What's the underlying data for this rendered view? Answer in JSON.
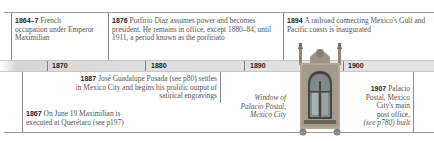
{
  "timeline": {
    "decades": [
      "1870",
      "1880",
      "1890",
      "1900"
    ],
    "events_above": [
      {
        "year": "1864–7",
        "text": "French occupation under Emperor Maximilian"
      },
      {
        "year": "1876",
        "text": "Porfirio Díaz assumes power and becomes president. He remains in office, except 1880–84, until 1911, a period known as the porfiriato"
      },
      {
        "year": "1894",
        "text": "A railroad connecting Mexico's Gulf and Pacific coasts is inaugurated"
      }
    ],
    "events_below": [
      {
        "year": "1887",
        "text": "José Guadalupe Posada (see p80) settles in Mexico City and begins his prolific output of satirical engravings"
      },
      {
        "year": "1867",
        "text": "On June 19 Maximilian is executed at Querétaro (see p197)"
      },
      {
        "year": "1907",
        "text": "Palacio Postal, Mexico City's main post office, (see p780) built"
      }
    ],
    "caption": "Window of Palacio Postal, Mexico City",
    "caption_lines": [
      "Window of",
      "Palacio Postal,",
      "Mexico City"
    ],
    "event_1907_lines": [
      "Palacio",
      "Postal, Mexico",
      "City's main",
      "post office,",
      "(see p780) built"
    ],
    "colors": {
      "bar": "#dedede",
      "rule": "#9a9a9a",
      "text": "#555555",
      "year": "#222222"
    }
  }
}
